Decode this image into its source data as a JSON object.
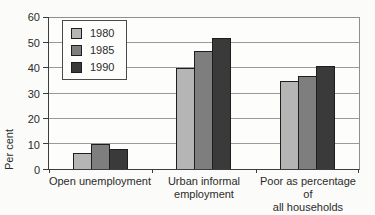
{
  "chart_data": {
    "type": "bar",
    "title": "",
    "ylabel": "Per cent",
    "xlabel": "",
    "categories": [
      "Open unemployment",
      "Urban informal employment",
      "Poor as percentage of all households"
    ],
    "category_label_lines": [
      [
        "Open unemployment"
      ],
      [
        "Urban informal",
        "employment"
      ],
      [
        "Poor as percentage of",
        "all households"
      ]
    ],
    "series": [
      {
        "name": "1980",
        "color": "#b5b5b5",
        "values": [
          6.5,
          40,
          35
        ]
      },
      {
        "name": "1985",
        "color": "#7e7e7e",
        "values": [
          10,
          47,
          37
        ]
      },
      {
        "name": "1990",
        "color": "#3a3a3a",
        "values": [
          8,
          52,
          41
        ]
      }
    ],
    "ylim": [
      0,
      60
    ],
    "yticks": [
      0,
      10,
      20,
      30,
      40,
      50,
      60
    ],
    "grid": true,
    "legend_position": "top-left-inside",
    "legend_entries": [
      "1980",
      "1985",
      "1990"
    ]
  },
  "colors": {
    "axis": "#3d3d3d",
    "gridline": "#9a9a9a",
    "bar_border": "#1e1e1e",
    "background": "#fbfbf9",
    "text": "#2b2b2b"
  }
}
